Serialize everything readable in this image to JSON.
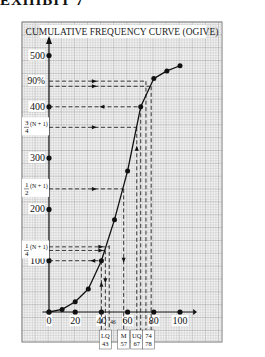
{
  "page": {
    "heading": "EXHIBIT 7"
  },
  "chart_data": {
    "type": "line",
    "title": "CUMULATIVE FREQUENCY CURVE (OGIVE)",
    "xlabel": "",
    "ylabel": "",
    "xlim": [
      0,
      110
    ],
    "ylim": [
      0,
      510
    ],
    "grid": true,
    "x_ticks": [
      "0",
      "20",
      "40",
      "60",
      "80",
      "100"
    ],
    "y_ticks": [
      "100",
      "200",
      "300",
      "400",
      "500"
    ],
    "series": [
      {
        "name": "Cumulative frequency",
        "x": [
          0,
          10,
          20,
          30,
          40,
          50,
          60,
          70,
          80,
          90,
          100
        ],
        "values": [
          0,
          5,
          20,
          45,
          100,
          180,
          275,
          400,
          455,
          470,
          480
        ]
      }
    ],
    "y_annotations": [
      {
        "label": "90%",
        "y": 450
      },
      {
        "label": "3/4 (N + 1)",
        "y": 360
      },
      {
        "label": "1/2 (N + 1)",
        "y": 240
      },
      {
        "label": "1/4 (N + 1)",
        "y": 120
      },
      {
        "label": "",
        "y": 440
      }
    ],
    "x_annotations": [
      {
        "label": "LQ 43",
        "x": 43
      },
      {
        "label": "46",
        "x": 46
      },
      {
        "label": "M 57",
        "x": 57
      },
      {
        "label": "UQ 67",
        "x": 67
      },
      {
        "label": "74",
        "x": 74
      },
      {
        "label": "78",
        "x": 78
      }
    ]
  }
}
